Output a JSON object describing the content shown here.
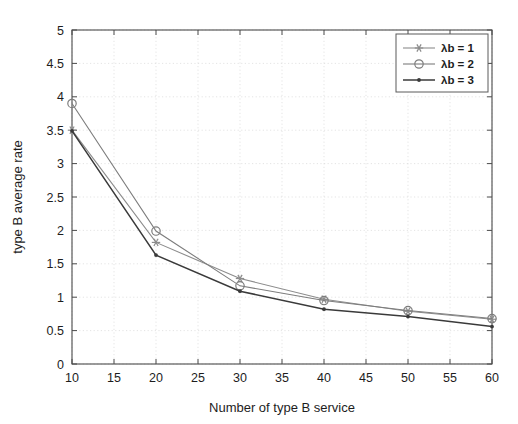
{
  "chart_data": {
    "type": "line",
    "title": "",
    "xlabel": "Number of type B service",
    "ylabel": "type B average rate",
    "xlim": [
      10,
      60
    ],
    "ylim": [
      0,
      5
    ],
    "xticks": [
      10,
      15,
      20,
      25,
      30,
      35,
      40,
      45,
      50,
      55,
      60
    ],
    "xtick_labels": [
      "10",
      "15",
      "20",
      "25",
      "30",
      "35",
      "40",
      "45",
      "50",
      "55",
      "60"
    ],
    "yticks": [
      0,
      0.5,
      1,
      1.5,
      2,
      2.5,
      3,
      3.5,
      4,
      4.5,
      5
    ],
    "ytick_labels": [
      "0",
      "0.5",
      "1",
      "1.5",
      "2",
      "2.5",
      "3",
      "3.5",
      "4",
      "4.5",
      "5"
    ],
    "grid": true,
    "legend_position": "top-right",
    "x": [
      10,
      20,
      30,
      40,
      50,
      60
    ],
    "series": [
      {
        "name": "λb = 1",
        "legend_label": "λb = 1",
        "marker": "asterisk",
        "color": "#8c8c8c",
        "values": [
          3.5,
          1.82,
          1.28,
          0.97,
          0.79,
          0.67
        ]
      },
      {
        "name": "λb = 2",
        "legend_label": "λb = 2",
        "marker": "circle",
        "color": "#7d7d7d",
        "values": [
          3.9,
          1.99,
          1.17,
          0.95,
          0.8,
          0.68
        ]
      },
      {
        "name": "λb = 3",
        "legend_label": "λb = 3",
        "marker": "dot",
        "color": "#3a3a3a",
        "values": [
          3.49,
          1.63,
          1.09,
          0.82,
          0.71,
          0.56
        ]
      }
    ]
  },
  "axes": {
    "x_title": "Number of type B service",
    "y_title": "type B average rate"
  },
  "legend": {
    "items": [
      {
        "label": "λb = 1"
      },
      {
        "label": "λb = 2"
      },
      {
        "label": "λb = 3"
      }
    ]
  },
  "colors": {
    "axis": "#4a4a4a",
    "grid": "#d8d8d8",
    "series1": "#8c8c8c",
    "series2": "#7d7d7d",
    "series3": "#3a3a3a",
    "background": "#ffffff"
  }
}
